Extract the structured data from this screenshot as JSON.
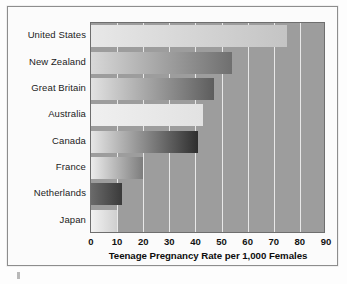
{
  "figure": {
    "background_color": "#fdfdfd",
    "frame_border_color": "#8d8d8d",
    "plot_background_color": "#9d9d9d",
    "gridline_color": "#e8e8e8"
  },
  "chart_data": {
    "type": "bar",
    "orientation": "horizontal",
    "title": "",
    "xlabel": "Teenage Pregnancy Rate per 1,000 Females",
    "ylabel": "",
    "categories": [
      "United States",
      "New Zealand",
      "Great Britain",
      "Australia",
      "Canada",
      "France",
      "Netherlands",
      "Japan"
    ],
    "values": [
      75,
      54,
      47,
      43,
      41,
      20,
      12,
      10
    ],
    "xlim": [
      0,
      90
    ],
    "xticks": [
      0,
      10,
      20,
      30,
      40,
      50,
      60,
      70,
      80,
      90
    ],
    "xtick_labels": [
      "0",
      "10",
      "20",
      "30",
      "40",
      "50",
      "60",
      "70",
      "80",
      "90"
    ],
    "grid": "vertical",
    "legend": "none",
    "bar_style": "horizontal grayscale gradient, light to dark",
    "bar_gradients": [
      {
        "category": "United States",
        "from": "#e8e8e8",
        "to": "#c4c4c4"
      },
      {
        "category": "New Zealand",
        "from": "#d8d8d8",
        "to": "#6f6f6f"
      },
      {
        "category": "Great Britain",
        "from": "#e2e2e2",
        "to": "#5d5d5d"
      },
      {
        "category": "Australia",
        "from": "#f0f0f0",
        "to": "#e2e2e2"
      },
      {
        "category": "Canada",
        "from": "#e6e6e6",
        "to": "#2e2e2e"
      },
      {
        "category": "France",
        "from": "#ececec",
        "to": "#7d7d7d"
      },
      {
        "category": "Netherlands",
        "from": "#6a6a6a",
        "to": "#3a3a3a"
      },
      {
        "category": "Japan",
        "from": "#f2f2f2",
        "to": "#cfcfcf"
      }
    ]
  }
}
